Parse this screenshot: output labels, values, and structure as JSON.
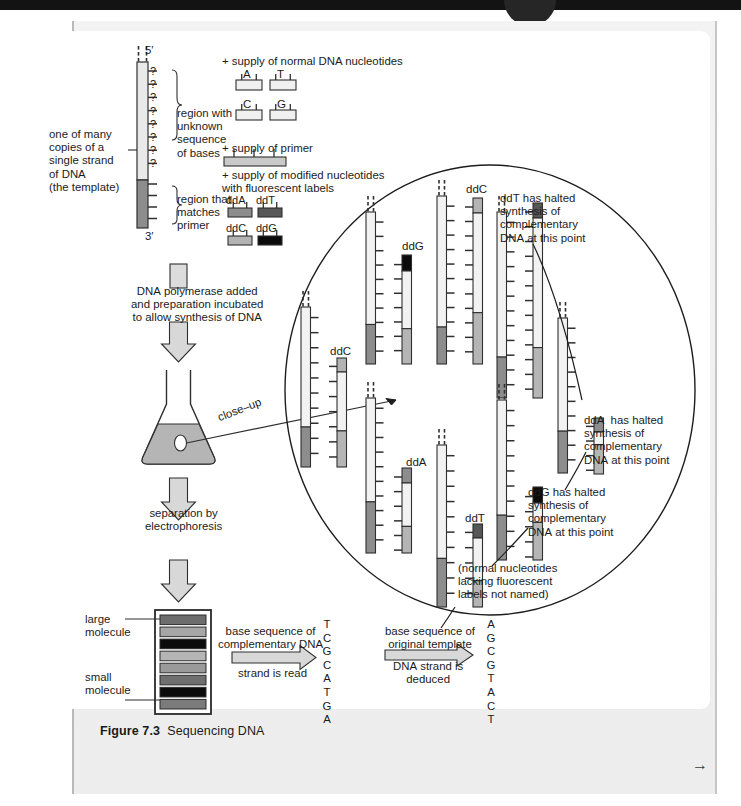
{
  "figure": {
    "caption_label": "Figure 7.3",
    "caption_title": "Sequencing DNA",
    "next_icon": "→"
  },
  "colors": {
    "ddA": "#8d8d8d",
    "ddT": "#575757",
    "ddC": "#b3b3b3",
    "ddG": "#0b0b0b",
    "primer_region": "#8d8d8d",
    "template_unknown": "#e9e9e9",
    "ink": "#2b2b2b",
    "flask_fill": "#b5b5b5",
    "arrow_fill": "#d8d8d8"
  },
  "template": {
    "five_prime": "5′",
    "three_prime": "3′",
    "question_mark": "?",
    "question_count": 8,
    "label_left": "one of many\ncopies of a\nsingle strand\nof DNA\n(the template)",
    "label_unknown": "region with\nunknown\nsequence\nof bases",
    "label_primer": "region that\nmatches\nprimer"
  },
  "supplies": {
    "normal_heading": "+ supply of normal DNA nucleotides",
    "normal_bases": [
      "A",
      "T",
      "C",
      "G"
    ],
    "primer_heading": "+ supply of primer",
    "modified_heading": "+ supply of modified nucleotides\nwith fluorescent labels",
    "modified_labels": [
      "ddA",
      "ddT",
      "ddC",
      "ddG"
    ]
  },
  "steps": {
    "polymerase": "DNA polymerase added\nand preparation incubated\nto allow synthesis of DNA",
    "closeup": "close–up",
    "electrophoresis": "separation by\nelectrophoresis"
  },
  "gel": {
    "large_label": "large\nmolecule",
    "small_label": "small\nmolecule",
    "bands": [
      "#6d6d6d",
      "#a6a6a6",
      "#0b0b0b",
      "#b5b5b5",
      "#9a9a9a",
      "#6f6f6f",
      "#0b0b0b",
      "#7b7b7b"
    ]
  },
  "reading": {
    "arrow1_above": "base sequence of\ncomplementary DNA",
    "arrow1_below": "strand is read",
    "arrow2_above": "base sequence of\noriginal template",
    "arrow2_below": "DNA strand is\ndeduced",
    "complementary_sequence": [
      "T",
      "C",
      "G",
      "C",
      "A",
      "T",
      "G",
      "A"
    ],
    "original_sequence": [
      "A",
      "G",
      "C",
      "G",
      "T",
      "A",
      "C",
      "T"
    ]
  },
  "closeup": {
    "annotations": [
      "ddT has halted\nsynthesis of\ncomplementary\nDNA at this point",
      "ddA  has halted\nsynthesis of\ncomplementary\nDNA at this point",
      "ddG has halted\nsynthesis of\ncomplementary\nDNA at this point",
      "(normal nucleotides\nlacking fluorescent\nlabels not named)"
    ],
    "strand_labels": [
      "ddG",
      "ddC",
      "ddT",
      "ddC",
      "ddA",
      "ddT",
      "ddG",
      "ddA"
    ]
  }
}
